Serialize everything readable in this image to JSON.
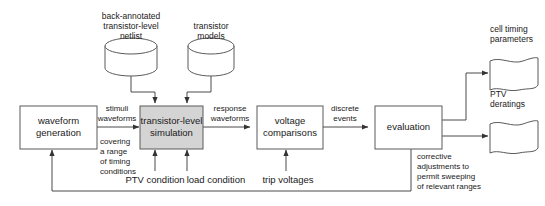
{
  "diagram": {
    "colors": {
      "stroke": "#5a5a5a",
      "connector": "#4a4a4a",
      "shaded_fill": "#d4d4d4",
      "plain_fill": "#ffffff",
      "text": "#1a1a1a"
    },
    "data_stores": [
      {
        "id": "back-annotated-netlist",
        "shape": "cylinder",
        "lines": [
          "back-annotated",
          "transistor-level",
          "netlist"
        ]
      },
      {
        "id": "transistor-models",
        "shape": "cylinder",
        "lines": [
          "transistor",
          "models"
        ]
      }
    ],
    "process_boxes": [
      {
        "id": "waveform-generation",
        "shaded": false,
        "lines": [
          "waveform",
          "generation"
        ]
      },
      {
        "id": "transistor-level-simulation",
        "shaded": true,
        "lines": [
          "transistor-level",
          "simulation"
        ]
      },
      {
        "id": "voltage-comparisons",
        "shaded": false,
        "lines": [
          "voltage",
          "comparisons"
        ]
      },
      {
        "id": "evaluation",
        "shaded": false,
        "lines": [
          "evaluation"
        ]
      }
    ],
    "outputs": [
      {
        "id": "cell-timing-parameters",
        "shape": "wavy-document",
        "lines": [
          "cell timing",
          "parameters"
        ]
      },
      {
        "id": "ptv-deratings",
        "shape": "wavy-document",
        "lines": [
          "PTV",
          "deratings"
        ]
      }
    ],
    "edge_labels": [
      {
        "id": "stimuli-waveforms",
        "lines": [
          "stimuli",
          "waveforms"
        ]
      },
      {
        "id": "covering-range-timing",
        "lines": [
          "covering",
          "a range",
          "of timing",
          "conditions"
        ]
      },
      {
        "id": "response-waveforms",
        "lines": [
          "response",
          "waveforms"
        ]
      },
      {
        "id": "discrete-events",
        "lines": [
          "discrete",
          "events"
        ]
      },
      {
        "id": "corrective-adjustments",
        "lines": [
          "corrective",
          "adjustments to",
          "permit sweeping",
          "of relevant ranges"
        ]
      }
    ],
    "inputs": [
      {
        "id": "ptv-condition",
        "label": "PTV condition"
      },
      {
        "id": "load-condition",
        "label": "load condition"
      },
      {
        "id": "trip-voltages",
        "label": "trip voltages"
      }
    ]
  }
}
